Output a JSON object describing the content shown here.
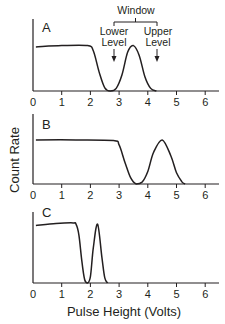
{
  "chart_data": [
    {
      "type": "line",
      "panel_label": "A",
      "xlabel": "Pulse Height (Volts)",
      "ylabel": "Count Rate",
      "xlim": [
        0,
        6.5
      ],
      "x_ticks": [
        "0",
        "1",
        "2",
        "3",
        "4",
        "5",
        "6"
      ],
      "grid": false,
      "description": "Compton-like plateau ~0.7 relative height from 0.1 to 2 V, falls to zero near 2.6 V; photopeak centered at 3.5 V (height ~0.7)",
      "series": [
        {
          "name": "spectrum",
          "x": [
            0.1,
            1.0,
            1.9,
            2.1,
            2.3,
            2.5,
            2.7,
            2.9,
            3.1,
            3.3,
            3.5,
            3.7,
            3.9,
            4.1,
            4.3
          ],
          "y": [
            0.68,
            0.7,
            0.7,
            0.62,
            0.3,
            0.05,
            0.0,
            0.04,
            0.25,
            0.6,
            0.7,
            0.55,
            0.22,
            0.04,
            0.0
          ]
        }
      ],
      "annotations": [
        {
          "text": "Window",
          "type": "bracket",
          "x_range": [
            2.8,
            4.3
          ]
        },
        {
          "text": "Lower Level",
          "type": "arrow",
          "x": 2.8
        },
        {
          "text": "Upper Level",
          "type": "arrow",
          "x": 4.3
        }
      ]
    },
    {
      "type": "line",
      "panel_label": "B",
      "xlabel": "Pulse Height (Volts)",
      "ylabel": "Count Rate",
      "xlim": [
        0,
        6.5
      ],
      "x_ticks": [
        "0",
        "1",
        "2",
        "3",
        "4",
        "5",
        "6"
      ],
      "grid": false,
      "description": "Plateau to ~2.9 V, falls to zero near 3.6 V; photopeak centered at 4.5 V",
      "series": [
        {
          "name": "spectrum",
          "x": [
            0.1,
            1.5,
            2.8,
            3.0,
            3.2,
            3.4,
            3.6,
            3.8,
            4.0,
            4.2,
            4.5,
            4.8,
            5.0,
            5.2,
            5.3
          ],
          "y": [
            0.7,
            0.7,
            0.69,
            0.62,
            0.35,
            0.1,
            0.0,
            0.03,
            0.2,
            0.5,
            0.7,
            0.45,
            0.18,
            0.03,
            0.0
          ]
        }
      ]
    },
    {
      "type": "line",
      "panel_label": "C",
      "xlabel": "Pulse Height (Volts)",
      "ylabel": "Count Rate",
      "xlim": [
        0,
        6.5
      ],
      "x_ticks": [
        "0",
        "1",
        "2",
        "3",
        "4",
        "5",
        "6"
      ],
      "grid": false,
      "description": "Tall plateau to ~1.5 V, sharp drop to zero near 1.85 V; narrow photopeak centered at 2.25 V",
      "series": [
        {
          "name": "spectrum",
          "x": [
            0.1,
            0.8,
            1.4,
            1.5,
            1.6,
            1.7,
            1.8,
            1.9,
            2.0,
            2.1,
            2.25,
            2.4,
            2.5,
            2.6
          ],
          "y": [
            0.9,
            0.93,
            0.94,
            0.92,
            0.75,
            0.35,
            0.05,
            0.0,
            0.1,
            0.55,
            0.92,
            0.4,
            0.08,
            0.0
          ]
        }
      ]
    }
  ],
  "labels": {
    "y_axis": "Count Rate",
    "x_axis": "Pulse Height (Volts)",
    "window": "Window",
    "lower_1": "Lower",
    "lower_2": "Level",
    "upper_1": "Upper",
    "upper_2": "Level",
    "panel_a": "A",
    "panel_b": "B",
    "panel_c": "C",
    "ticks": [
      "0",
      "1",
      "2",
      "3",
      "4",
      "5",
      "6"
    ]
  },
  "colors": {
    "ink": "#231f20",
    "background": "#ffffff"
  }
}
